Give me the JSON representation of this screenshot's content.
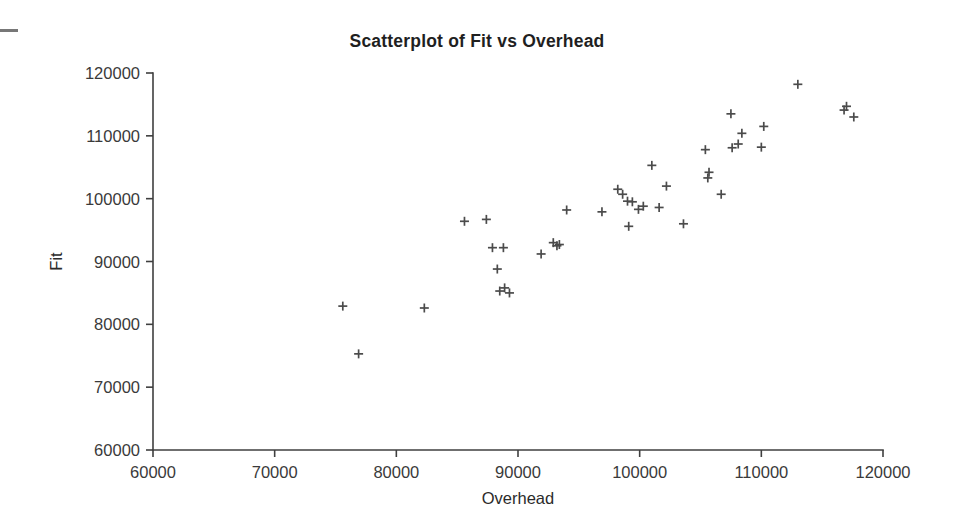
{
  "page": {
    "background_color": "#ffffff",
    "ink_color": "#3f3f3f",
    "marker_color": "#4b4b4b"
  },
  "artifact": {
    "name": "scan-edge-mark",
    "label": ""
  },
  "chart_data": {
    "type": "scatter",
    "title": "Scatterplot of Fit vs Overhead",
    "xlabel": "Overhead",
    "ylabel": "Fit",
    "xlim": [
      60000,
      120000
    ],
    "ylim": [
      60000,
      120000
    ],
    "xticks": [
      60000,
      70000,
      80000,
      90000,
      100000,
      110000,
      120000
    ],
    "yticks": [
      60000,
      70000,
      80000,
      90000,
      100000,
      110000,
      120000
    ],
    "xtick_labels": [
      "60000",
      "70000",
      "80000",
      "90000",
      "100000",
      "110000",
      "120000"
    ],
    "ytick_labels": [
      "60000",
      "70000",
      "80000",
      "90000",
      "100000",
      "110000",
      "120000"
    ],
    "grid": false,
    "legend": null,
    "marker": "plus",
    "marker_size": 9,
    "series": [
      {
        "name": "Fit vs Overhead",
        "x": [
          75600,
          76900,
          82300,
          85600,
          87400,
          88800,
          87900,
          88300,
          88900,
          88500,
          89300,
          91900,
          92900,
          93400,
          93200,
          94000,
          96900,
          98200,
          98600,
          99000,
          99400,
          99100,
          99900,
          100300,
          101000,
          101600,
          102200,
          103600,
          105400,
          105700,
          105600,
          106700,
          107500,
          108100,
          107600,
          108400,
          110200,
          110000,
          113000,
          117000,
          116800,
          117600
        ],
        "y": [
          82900,
          75300,
          82600,
          96400,
          96700,
          92200,
          92200,
          88800,
          85800,
          85300,
          85000,
          91200,
          93000,
          92700,
          92500,
          98200,
          97900,
          101500,
          100700,
          99600,
          99500,
          95600,
          98300,
          98800,
          105300,
          98600,
          102000,
          96000,
          107800,
          104200,
          103300,
          100700,
          113500,
          108700,
          108100,
          110400,
          111500,
          108200,
          118200,
          114700,
          114100,
          113000
        ]
      }
    ]
  },
  "axes_geometry": {
    "plot_left": 153,
    "plot_right": 883,
    "plot_top": 73,
    "plot_bottom": 450
  }
}
